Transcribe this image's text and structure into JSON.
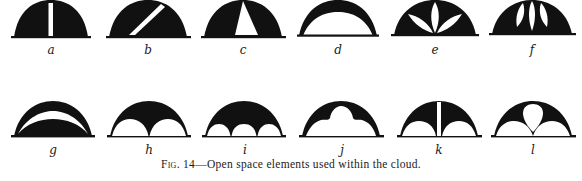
{
  "figure": {
    "caption_prefix": "Fig. 14",
    "caption_text": "—Open space elements used within the cloud.",
    "ink_color": "#111111",
    "paper_color": "#ffffff"
  },
  "elements": [
    {
      "id": "a",
      "label": "a",
      "description": "half-dome with single vertical white slit"
    },
    {
      "id": "b",
      "label": "b",
      "description": "half-dome with diagonal white slit"
    },
    {
      "id": "c",
      "label": "c",
      "description": "half-dome with white triangular opening from apex"
    },
    {
      "id": "d",
      "label": "d",
      "description": "thin black arch crescent over large white opening"
    },
    {
      "id": "e",
      "label": "e",
      "description": "half-dome with three white leaf-shaped openings"
    },
    {
      "id": "f",
      "label": "f",
      "description": "half-dome with three tall white petal openings"
    },
    {
      "id": "g",
      "label": "g",
      "description": "half-dome with crescent-shaped white band"
    },
    {
      "id": "h",
      "label": "h",
      "description": "half-dome with two white semicircular scallops at base"
    },
    {
      "id": "i",
      "label": "i",
      "description": "half-dome with three white semicircular scallops at base"
    },
    {
      "id": "j",
      "label": "j",
      "description": "arch with cloud-shaped white opening"
    },
    {
      "id": "k",
      "label": "k",
      "description": "half-dome with vertical slit and two base scallops"
    },
    {
      "id": "l",
      "label": "l",
      "description": "half-dome with teardrop opening and two base scallops"
    }
  ]
}
